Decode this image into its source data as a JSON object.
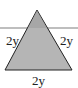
{
  "diagram": {
    "type": "equilateral-triangle",
    "colors": {
      "fill": "#b5b5b5",
      "stroke": "#222222",
      "line": "#a8a8a8"
    },
    "labels": {
      "left": "2y",
      "right": "2y",
      "bottom": "2y"
    }
  }
}
